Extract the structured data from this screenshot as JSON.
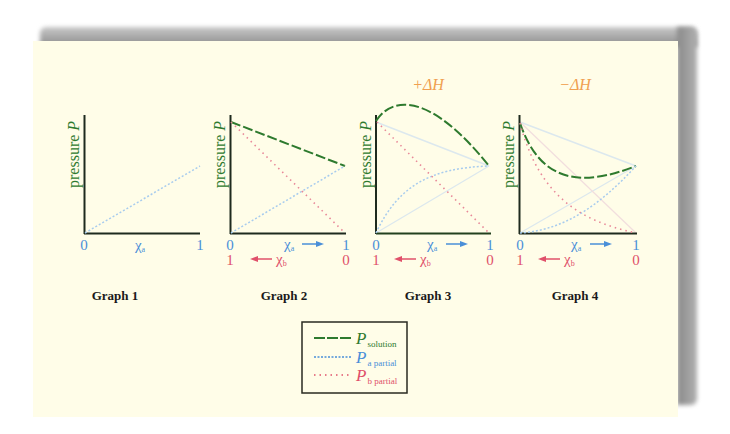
{
  "figure": {
    "graphs": [
      {
        "label": "Graph 1",
        "y_axis_label": "pressure",
        "y_axis_symbol": "P",
        "x_tick_a_start": "0",
        "x_tick_a_end": "1",
        "x_var_a": "χ",
        "x_var_a_sub": "a",
        "curves": [
          "P a partial (dotted, linear from 0 to mid-height)"
        ]
      },
      {
        "label": "Graph 2",
        "y_axis_label": "pressure",
        "y_axis_symbol": "P",
        "x_tick_a_start": "0",
        "x_tick_a_end": "1",
        "x_tick_b_start": "1",
        "x_tick_b_end": "0",
        "x_var_a": "χ",
        "x_var_a_sub": "a",
        "x_var_b": "χ",
        "x_var_b_sub": "b",
        "curves": [
          "P solution (dashed, linear)",
          "P a partial (dotted, linear)",
          "P b partial (dotted, linear)"
        ]
      },
      {
        "label": "Graph 3",
        "header": "+ΔH",
        "y_axis_label": "pressure",
        "y_axis_symbol": "P",
        "x_tick_a_start": "0",
        "x_tick_a_end": "1",
        "x_tick_b_start": "1",
        "x_tick_b_end": "0",
        "x_var_a": "χ",
        "x_var_a_sub": "a",
        "x_var_b": "χ",
        "x_var_b_sub": "b",
        "curves": [
          "P solution (dashed, concave, positive deviation)",
          "P a partial (dotted, concave)",
          "P b partial (dotted, linear)"
        ]
      },
      {
        "label": "Graph 4",
        "header": "−ΔH",
        "y_axis_label": "pressure",
        "y_axis_symbol": "P",
        "x_tick_a_start": "0",
        "x_tick_a_end": "1",
        "x_tick_b_start": "1",
        "x_tick_b_end": "0",
        "x_var_a": "χ",
        "x_var_a_sub": "a",
        "x_var_b": "χ",
        "x_var_b_sub": "b",
        "curves": [
          "P solution (dashed, convex, negative deviation)",
          "P a partial (dotted, convex)",
          "P b partial (dotted, convex)"
        ]
      }
    ],
    "legend": {
      "items": [
        {
          "symbol": "P",
          "subscript": "solution",
          "style": "dashed",
          "color": "#2e7a2e"
        },
        {
          "symbol": "P",
          "subscript": "a partial",
          "style": "dotted",
          "color": "#4a8fd8"
        },
        {
          "symbol": "P",
          "subscript": "b partial",
          "style": "dotted",
          "color": "#e0506a"
        }
      ]
    },
    "colors": {
      "solution": "#2e7a2e",
      "a_partial": "#4a8fd8",
      "b_partial": "#e0506a",
      "axis": "#1e2a1e",
      "heading": "#f0a050",
      "background": "#fffde8"
    }
  }
}
